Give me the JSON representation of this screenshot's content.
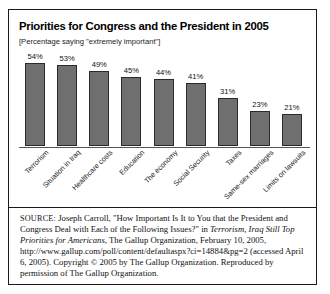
{
  "figure": {
    "title": "Priorities for Congress and the President in 2005",
    "subtitle": "[Percentage saying \"extremely important\"]",
    "source": {
      "label": "SOURCE:",
      "author_and_article": " Joseph Carroll, \"How Important Is It to You that the President and Congress Deal with Each of the Following Issues?\" in ",
      "publication_italic": "Terrorism, Iraq Still Top Priorities for Americans",
      "rest": ", The Gallup Organization, February 10, 2005, http://www.gallup.com/poll/content/defaultaspx?ci=14884&pg=2 (accessed April 6, 2005). Copyright © 2005 by The Gallup Organization. Reproduced by permission of The Gallup Organization."
    }
  },
  "chart_data": {
    "type": "bar",
    "title": "Priorities for Congress and the President in 2005",
    "subtitle": "[Percentage saying \"extremely important\"]",
    "xlabel": "",
    "ylabel": "",
    "ylim": [
      0,
      60
    ],
    "grid": false,
    "legend": false,
    "categories": [
      "Terrorism",
      "Situation in Iraq",
      "Healthcare costs",
      "Education",
      "The economy",
      "Social Security",
      "Taxes",
      "Same-sex marriages",
      "Limits on lawsuits"
    ],
    "values": [
      54,
      53,
      49,
      45,
      44,
      41,
      31,
      23,
      21
    ],
    "data_labels": [
      "54%",
      "53%",
      "49%",
      "45%",
      "44%",
      "41%",
      "31%",
      "23%",
      "21%"
    ],
    "bar_color": "#6f6f6f",
    "bar_edge_color": "#2a2a2a"
  }
}
